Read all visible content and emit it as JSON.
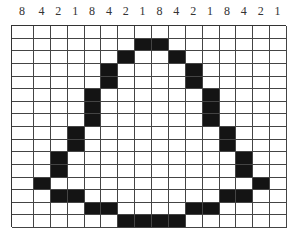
{
  "column_labels": [
    "8",
    "4",
    "2",
    "1",
    "8",
    "4",
    "2",
    "1",
    "8",
    "4",
    "2",
    "1",
    "8",
    "4",
    "2",
    "1"
  ],
  "grid": {
    "columns": 16,
    "rows": 16,
    "filled_color": "#141414",
    "empty_color": "#ffffff",
    "filled_cells": [
      [],
      [
        7,
        8
      ],
      [
        6,
        9
      ],
      [
        5,
        10
      ],
      [
        5,
        10
      ],
      [
        4,
        11
      ],
      [
        4,
        11
      ],
      [
        4,
        11
      ],
      [
        3,
        12
      ],
      [
        3,
        12
      ],
      [
        2,
        13
      ],
      [
        2,
        13
      ],
      [
        1,
        14
      ],
      [
        2,
        3,
        12,
        13
      ],
      [
        4,
        5,
        10,
        11
      ],
      [
        6,
        7,
        8,
        9
      ]
    ]
  }
}
